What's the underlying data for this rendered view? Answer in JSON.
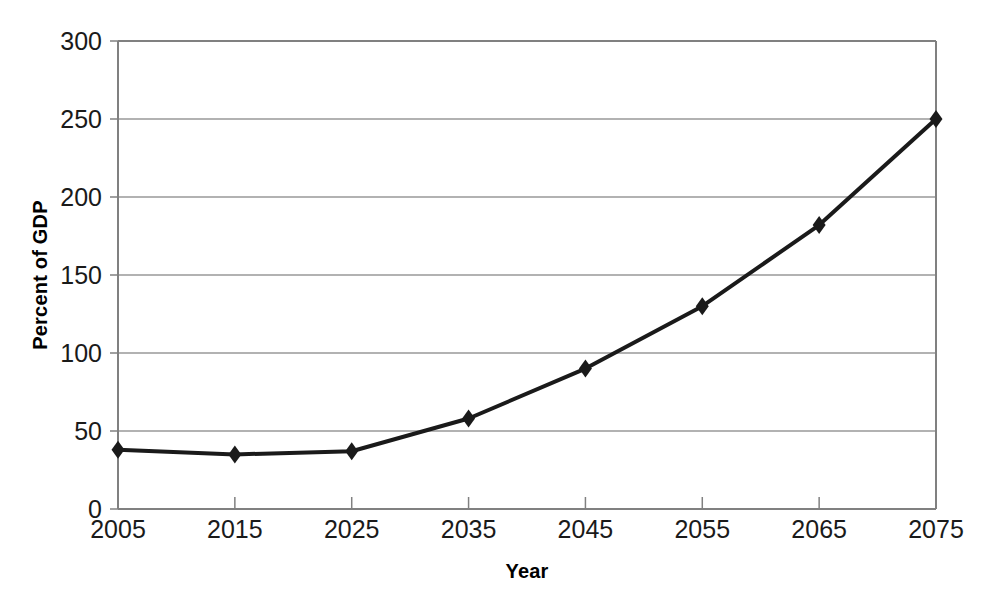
{
  "chart_data": {
    "type": "line",
    "title": "",
    "subtitle": "",
    "xlabel": "Year",
    "ylabel": "Percent of GDP",
    "x": [
      2005,
      2015,
      2025,
      2035,
      2045,
      2055,
      2065,
      2075
    ],
    "categories": [
      "2005",
      "2015",
      "2025",
      "2035",
      "2045",
      "2055",
      "2065",
      "2075"
    ],
    "values": [
      38,
      35,
      37,
      58,
      90,
      130,
      182,
      250
    ],
    "series": [
      {
        "name": "Debt held by the public",
        "values": [
          38,
          35,
          37,
          58,
          90,
          130,
          182,
          250
        ]
      }
    ],
    "xlim": [
      2005,
      2075
    ],
    "ylim": [
      0,
      300
    ],
    "xticks": [
      2005,
      2015,
      2025,
      2035,
      2045,
      2055,
      2065,
      2075
    ],
    "yticks": [
      0,
      50,
      100,
      150,
      200,
      250,
      300
    ],
    "ytick_labels": [
      "0",
      "50",
      "100",
      "150",
      "200",
      "250",
      "300"
    ],
    "xtick_labels": [
      "2005",
      "2015",
      "2025",
      "2035",
      "2045",
      "2055",
      "2065",
      "2075"
    ],
    "grid": "horizontal",
    "legend": "none",
    "marker": "diamond",
    "line_color": "#1a1a1a",
    "marker_color": "#1a1a1a",
    "grid_color": "#999999",
    "axis_color": "#808080",
    "background": "#ffffff",
    "annotations": []
  }
}
